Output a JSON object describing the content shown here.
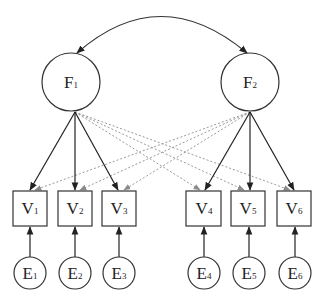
{
  "diagram": {
    "type": "structural-equation-model",
    "colors": {
      "stroke": "#333333",
      "cross_loading": "#9a9a9a",
      "background": "#ffffff"
    },
    "covariance": {
      "from": "F1",
      "to": "F2",
      "label": "",
      "bidirectional": true
    },
    "factors": [
      {
        "id": "F1",
        "letter": "F",
        "sub": "1",
        "cx": 71,
        "cy": 82,
        "r": 29
      },
      {
        "id": "F2",
        "letter": "F",
        "sub": "2",
        "cx": 250,
        "cy": 82,
        "r": 29
      }
    ],
    "observed": [
      {
        "id": "V1",
        "letter": "V",
        "sub": "1",
        "x": 13,
        "y": 191,
        "w": 34,
        "h": 35
      },
      {
        "id": "V2",
        "letter": "V",
        "sub": "2",
        "x": 58,
        "y": 191,
        "w": 34,
        "h": 35
      },
      {
        "id": "V3",
        "letter": "V",
        "sub": "3",
        "x": 102,
        "y": 191,
        "w": 34,
        "h": 35
      },
      {
        "id": "V4",
        "letter": "V",
        "sub": "4",
        "x": 186,
        "y": 191,
        "w": 35,
        "h": 35
      },
      {
        "id": "V5",
        "letter": "V",
        "sub": "5",
        "x": 231,
        "y": 191,
        "w": 34,
        "h": 35
      },
      {
        "id": "V6",
        "letter": "V",
        "sub": "6",
        "x": 277,
        "y": 191,
        "w": 34,
        "h": 35
      }
    ],
    "errors": [
      {
        "id": "E1",
        "letter": "E",
        "sub": "1",
        "cx": 30,
        "cy": 273,
        "r": 16
      },
      {
        "id": "E2",
        "letter": "E",
        "sub": "2",
        "cx": 75,
        "cy": 273,
        "r": 16
      },
      {
        "id": "E3",
        "letter": "E",
        "sub": "3",
        "cx": 119,
        "cy": 273,
        "r": 16
      },
      {
        "id": "E4",
        "letter": "E",
        "sub": "4",
        "cx": 204,
        "cy": 273,
        "r": 16
      },
      {
        "id": "E5",
        "letter": "E",
        "sub": "5",
        "cx": 249,
        "cy": 273,
        "r": 16
      },
      {
        "id": "E6",
        "letter": "E",
        "sub": "6",
        "cx": 295,
        "cy": 273,
        "r": 16
      }
    ],
    "loadings": [
      {
        "from": "F1",
        "to": "V1",
        "style": "solid"
      },
      {
        "from": "F1",
        "to": "V2",
        "style": "solid"
      },
      {
        "from": "F1",
        "to": "V3",
        "style": "solid"
      },
      {
        "from": "F2",
        "to": "V4",
        "style": "solid"
      },
      {
        "from": "F2",
        "to": "V5",
        "style": "solid"
      },
      {
        "from": "F2",
        "to": "V6",
        "style": "solid"
      },
      {
        "from": "F1",
        "to": "V4",
        "style": "dashed"
      },
      {
        "from": "F1",
        "to": "V5",
        "style": "dashed"
      },
      {
        "from": "F1",
        "to": "V6",
        "style": "dashed"
      },
      {
        "from": "F2",
        "to": "V1",
        "style": "dashed"
      },
      {
        "from": "F2",
        "to": "V2",
        "style": "dashed"
      },
      {
        "from": "F2",
        "to": "V3",
        "style": "dashed"
      }
    ],
    "error_paths": [
      {
        "from": "E1",
        "to": "V1"
      },
      {
        "from": "E2",
        "to": "V2"
      },
      {
        "from": "E3",
        "to": "V3"
      },
      {
        "from": "E4",
        "to": "V4"
      },
      {
        "from": "E5",
        "to": "V5"
      },
      {
        "from": "E6",
        "to": "V6"
      }
    ]
  }
}
